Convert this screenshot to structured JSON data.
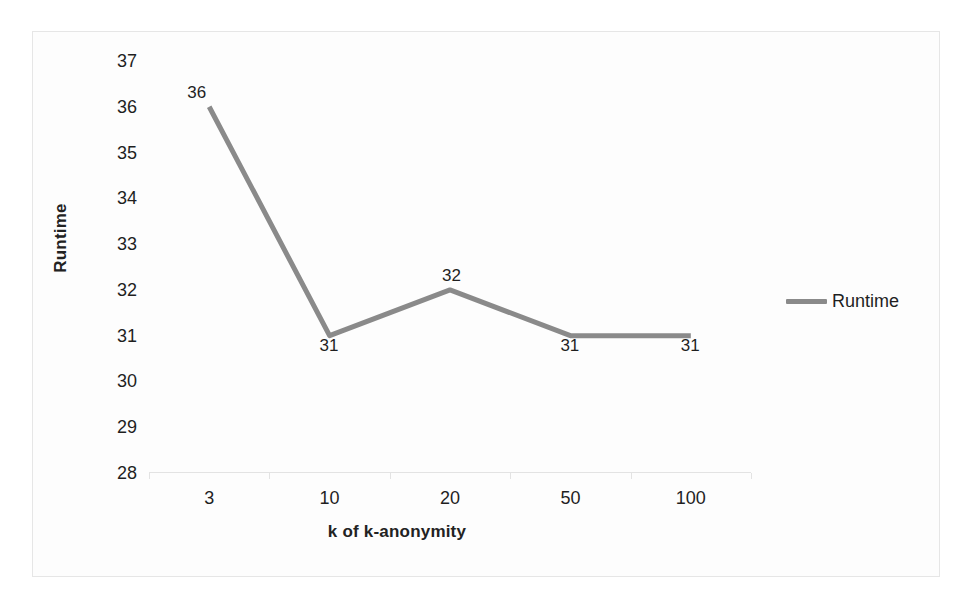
{
  "chart_data": {
    "type": "line",
    "title": "",
    "xlabel": "k of k-anonymity",
    "ylabel": "Runtime",
    "categories": [
      "3",
      "10",
      "20",
      "50",
      "100"
    ],
    "series": [
      {
        "name": "Runtime",
        "values": [
          36,
          31,
          32,
          31,
          31
        ],
        "color": "#8a8a8a"
      }
    ],
    "point_labels": [
      "36",
      "31",
      "32",
      "31",
      "31"
    ],
    "ylim": [
      28,
      37
    ],
    "yticks": [
      "37",
      "36",
      "35",
      "34",
      "33",
      "32",
      "31",
      "30",
      "29",
      "28"
    ],
    "ytick_values": [
      37,
      36,
      35,
      34,
      33,
      32,
      31,
      30,
      29,
      28
    ],
    "grid": false,
    "legend_position": "right",
    "legend_entries": [
      "Runtime"
    ],
    "axis_line_color": "#e3e3e3",
    "border_color": "#e6e6e6",
    "background_color": "#fdfdfd",
    "data_label_color": "#1f1f1f"
  },
  "legend": {
    "runtime_label": "Runtime"
  },
  "axes": {
    "x_title": "k of k-anonymity",
    "y_title": "Runtime"
  }
}
